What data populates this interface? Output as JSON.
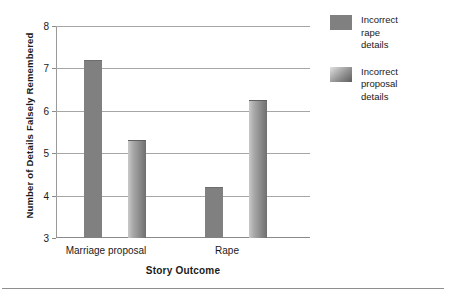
{
  "chart_data": {
    "type": "bar",
    "title": "",
    "xlabel": "Story Outcome",
    "ylabel": "Number of Details Falsely Remembered",
    "categories": [
      "Marriage proposal",
      "Rape"
    ],
    "ylim": [
      3,
      8
    ],
    "yticks": [
      "3",
      "4",
      "5",
      "6",
      "7",
      "8"
    ],
    "grid": true,
    "legend_position": "right",
    "series": [
      {
        "name": "Incorrect rape details",
        "color": "#808080",
        "style": "solid",
        "values": [
          7.2,
          4.2
        ]
      },
      {
        "name": "Incorrect proposal details",
        "color": "#8d8d8d",
        "style": "gradient",
        "values": [
          5.3,
          6.25
        ]
      }
    ]
  },
  "legend": {
    "items": [
      {
        "label_line1": "Incorrect",
        "label_line2": "rape",
        "label_line3": "details"
      },
      {
        "label_line1": "Incorrect",
        "label_line2": "proposal",
        "label_line3": "details"
      }
    ]
  }
}
